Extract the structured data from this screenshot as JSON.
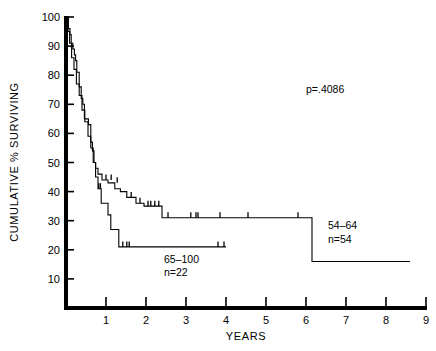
{
  "chart_data": {
    "type": "line",
    "title": "",
    "subtitle": "",
    "xlabel": "YEARS",
    "ylabel": "CUMULATIVE % SURVIVING",
    "xlim": [
      0,
      9
    ],
    "ylim": [
      0,
      100
    ],
    "xticks": [
      "1",
      "2",
      "3",
      "4",
      "5",
      "6",
      "7",
      "8",
      "9"
    ],
    "xtick_values": [
      1,
      2,
      3,
      4,
      5,
      6,
      7,
      8,
      9
    ],
    "yticks": [
      "10",
      "20",
      "30",
      "40",
      "50",
      "60",
      "70",
      "80",
      "90",
      "100"
    ],
    "ytick_values": [
      10,
      20,
      30,
      40,
      50,
      60,
      70,
      80,
      90,
      100
    ],
    "grid": false,
    "legend_position": "inline-annotation",
    "annotations": [
      {
        "name": "p-value",
        "text": "p=.4086",
        "x": 6.0,
        "y": 74
      },
      {
        "name": "group-54-64-label-line1",
        "text": "54–64",
        "x": 6.55,
        "y": 27
      },
      {
        "name": "group-54-64-label-line2",
        "text": "n=54",
        "x": 6.55,
        "y": 22.5
      },
      {
        "name": "group-65-100-label-line1",
        "text": "65–100",
        "x": 2.45,
        "y": 15.5
      },
      {
        "name": "group-65-100-label-line2",
        "text": "n=22",
        "x": 2.45,
        "y": 11
      }
    ],
    "series": [
      {
        "name": "54–64",
        "label": "54–64",
        "n": 54,
        "color": "#000000",
        "style": "step",
        "points": [
          [
            0.0,
            100
          ],
          [
            0.06,
            100
          ],
          [
            0.06,
            96
          ],
          [
            0.1,
            96
          ],
          [
            0.1,
            94
          ],
          [
            0.13,
            94
          ],
          [
            0.13,
            91
          ],
          [
            0.17,
            91
          ],
          [
            0.17,
            89
          ],
          [
            0.21,
            89
          ],
          [
            0.21,
            87
          ],
          [
            0.24,
            87
          ],
          [
            0.24,
            85
          ],
          [
            0.27,
            85
          ],
          [
            0.27,
            81
          ],
          [
            0.33,
            81
          ],
          [
            0.33,
            76
          ],
          [
            0.38,
            76
          ],
          [
            0.38,
            72
          ],
          [
            0.42,
            72
          ],
          [
            0.42,
            70
          ],
          [
            0.46,
            70
          ],
          [
            0.46,
            65
          ],
          [
            0.56,
            65
          ],
          [
            0.56,
            63
          ],
          [
            0.62,
            63
          ],
          [
            0.62,
            57
          ],
          [
            0.66,
            57
          ],
          [
            0.66,
            54
          ],
          [
            0.7,
            54
          ],
          [
            0.7,
            50
          ],
          [
            0.74,
            50
          ],
          [
            0.74,
            48
          ],
          [
            0.8,
            48
          ],
          [
            0.8,
            46
          ],
          [
            0.9,
            46
          ],
          [
            0.9,
            44
          ],
          [
            1.05,
            44
          ],
          [
            1.05,
            43
          ],
          [
            1.22,
            43
          ],
          [
            1.22,
            41
          ],
          [
            1.36,
            41
          ],
          [
            1.36,
            40
          ],
          [
            1.52,
            40
          ],
          [
            1.52,
            38
          ],
          [
            1.75,
            38
          ],
          [
            1.75,
            36
          ],
          [
            1.95,
            36
          ],
          [
            1.95,
            35
          ],
          [
            2.4,
            35
          ],
          [
            2.4,
            31
          ],
          [
            6.15,
            31
          ],
          [
            6.15,
            16
          ],
          [
            8.6,
            16
          ]
        ],
        "censor_marks": [
          [
            1.0,
            44
          ],
          [
            1.13,
            44
          ],
          [
            1.28,
            43
          ],
          [
            1.63,
            38
          ],
          [
            1.85,
            36
          ],
          [
            2.05,
            35
          ],
          [
            2.12,
            35
          ],
          [
            2.22,
            35
          ],
          [
            2.32,
            35
          ],
          [
            2.55,
            31
          ],
          [
            3.12,
            31
          ],
          [
            3.25,
            31
          ],
          [
            3.3,
            31
          ],
          [
            3.85,
            31
          ],
          [
            4.55,
            31
          ],
          [
            5.8,
            31
          ]
        ]
      },
      {
        "name": "65–100",
        "label": "65–100",
        "n": 22,
        "color": "#000000",
        "style": "step",
        "points": [
          [
            0.0,
            100
          ],
          [
            0.05,
            100
          ],
          [
            0.05,
            95
          ],
          [
            0.09,
            95
          ],
          [
            0.09,
            91
          ],
          [
            0.14,
            91
          ],
          [
            0.14,
            86
          ],
          [
            0.2,
            86
          ],
          [
            0.2,
            82
          ],
          [
            0.26,
            82
          ],
          [
            0.26,
            77
          ],
          [
            0.33,
            77
          ],
          [
            0.33,
            73
          ],
          [
            0.4,
            73
          ],
          [
            0.4,
            68
          ],
          [
            0.47,
            68
          ],
          [
            0.47,
            64
          ],
          [
            0.55,
            64
          ],
          [
            0.55,
            59
          ],
          [
            0.62,
            59
          ],
          [
            0.62,
            55
          ],
          [
            0.68,
            55
          ],
          [
            0.68,
            50
          ],
          [
            0.74,
            50
          ],
          [
            0.74,
            45
          ],
          [
            0.8,
            45
          ],
          [
            0.8,
            41
          ],
          [
            0.88,
            41
          ],
          [
            0.88,
            36
          ],
          [
            1.05,
            36
          ],
          [
            1.05,
            32
          ],
          [
            1.12,
            32
          ],
          [
            1.12,
            27
          ],
          [
            1.32,
            27
          ],
          [
            1.32,
            21
          ],
          [
            4.0,
            21
          ]
        ],
        "censor_marks": [
          [
            0.82,
            41
          ],
          [
            0.86,
            41
          ],
          [
            1.42,
            21
          ],
          [
            1.52,
            21
          ],
          [
            1.58,
            21
          ],
          [
            3.8,
            21
          ],
          [
            3.95,
            21
          ]
        ]
      }
    ]
  }
}
